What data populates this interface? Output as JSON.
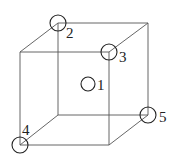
{
  "diagram": {
    "type": "cubic unit cell with atom positions",
    "vertices": {
      "front_tl": [
        20,
        52
      ],
      "front_tr": [
        109,
        52
      ],
      "front_bl": [
        20,
        145
      ],
      "front_br": [
        109,
        145
      ],
      "back_tl": [
        58,
        23
      ],
      "back_tr": [
        148,
        23
      ],
      "back_bl": [
        58,
        115
      ],
      "back_br": [
        148,
        115
      ]
    },
    "atoms": [
      {
        "id": "1",
        "label": "1",
        "cx": 88,
        "cy": 84,
        "r": 7,
        "lx": 97,
        "ly": 90,
        "position": "body-center"
      },
      {
        "id": "2",
        "label": "2",
        "cx": 58,
        "cy": 23,
        "r": 8,
        "lx": 66,
        "ly": 38,
        "position": "back-top-left corner"
      },
      {
        "id": "3",
        "label": "3",
        "cx": 109,
        "cy": 52,
        "r": 8,
        "lx": 119,
        "ly": 62,
        "position": "front-top-right corner"
      },
      {
        "id": "4",
        "label": "4",
        "cx": 20,
        "cy": 145,
        "r": 8,
        "lx": 22,
        "ly": 135,
        "position": "front-bottom-left corner"
      },
      {
        "id": "5",
        "label": "5",
        "cx": 148,
        "cy": 115,
        "r": 8,
        "lx": 159,
        "ly": 122,
        "position": "back-bottom-right corner"
      }
    ],
    "colors": {
      "edge": "#555555",
      "atom": "#222222",
      "background": "#ffffff"
    }
  }
}
